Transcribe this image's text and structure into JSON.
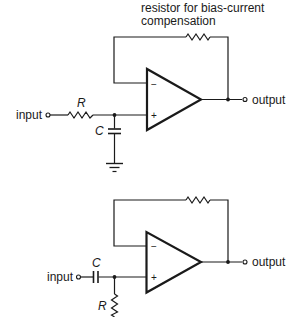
{
  "diagram": {
    "type": "op-amp circuit schematics",
    "stroke_color": "#1a1a1a",
    "background": "#ffffff",
    "annotation": {
      "line1": "resistor for bias-current",
      "line2": "compensation"
    },
    "circuit_top": {
      "name": "low-pass input with bias-current compensation",
      "input_label": "input",
      "output_label": "output",
      "series_resistor_label": "R",
      "shunt_capacitor_label": "C",
      "inverting_sign": "−",
      "noninverting_sign": "+",
      "components": [
        "input terminal",
        "series resistor R",
        "shunt capacitor C to ground",
        "op-amp",
        "feedback resistor",
        "output terminal"
      ]
    },
    "circuit_bottom": {
      "name": "high-pass input (AC-coupled) with bias-current compensation",
      "input_label": "input",
      "output_label": "output",
      "series_capacitor_label": "C",
      "shunt_resistor_label": "R",
      "inverting_sign": "−",
      "noninverting_sign": "+",
      "components": [
        "input terminal",
        "series capacitor C",
        "shunt resistor R",
        "op-amp",
        "feedback resistor",
        "output terminal"
      ]
    }
  }
}
